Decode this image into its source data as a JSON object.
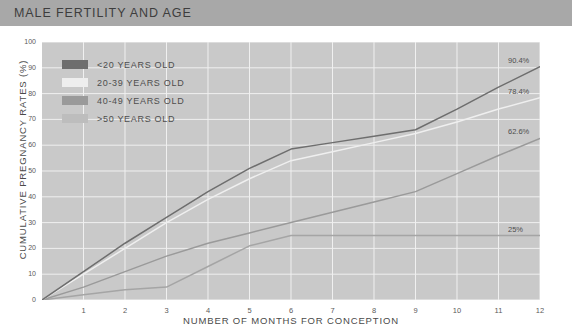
{
  "header": {
    "title": "MALE FERTILITY AND AGE",
    "bar_color": "#a8a8a8"
  },
  "legend": {
    "items": [
      {
        "label": "<20 YEARS OLD",
        "color": "#6e6e6e"
      },
      {
        "label": "20-39 YEARS OLD",
        "color": "#eeeeee"
      },
      {
        "label": "40-49 YEARS OLD",
        "color": "#9a9a9a"
      },
      {
        "label": ">50 YEARS OLD",
        "color": "#bdbdbd"
      }
    ]
  },
  "chart_data": {
    "type": "line",
    "title": "MALE FERTILITY AND AGE",
    "xlabel": "NUMBER OF MONTHS FOR CONCEPTION",
    "ylabel": "CUMULATIVE PREGNANCY RATES (%)",
    "xlim": [
      0,
      12
    ],
    "ylim": [
      0,
      100
    ],
    "xticks": [
      "1",
      "2",
      "3",
      "4",
      "5",
      "6",
      "7",
      "8",
      "9",
      "10",
      "11",
      "12"
    ],
    "yticks": [
      "0",
      "10",
      "20",
      "30",
      "40",
      "50",
      "60",
      "70",
      "80",
      "90",
      "100"
    ],
    "grid": true,
    "legend_position": "top-left",
    "plot_background": "#c9c9c9",
    "gridline_color": "#f0f0f0",
    "x": [
      0,
      1,
      2,
      3,
      4,
      5,
      6,
      7,
      8,
      9,
      10,
      11,
      12
    ],
    "series": [
      {
        "name": "<20 YEARS OLD",
        "color": "#6e6e6e",
        "values": [
          0,
          11,
          22,
          32,
          42,
          51,
          58.5,
          61,
          63.5,
          66,
          74,
          82.5,
          90.4
        ],
        "end_label": "90.4%"
      },
      {
        "name": "20-39 YEARS OLD",
        "color": "#efefef",
        "values": [
          0,
          10,
          20,
          30,
          39,
          47,
          54,
          57.5,
          61,
          64.5,
          69,
          74,
          78.4
        ],
        "end_label": "78.4%"
      },
      {
        "name": "40-49 YEARS OLD",
        "color": "#9a9a9a",
        "values": [
          0,
          5,
          11,
          17,
          22,
          26,
          30,
          34,
          38,
          42,
          49,
          56,
          62.6
        ],
        "end_label": "62.6%"
      },
      {
        "name": ">50 YEARS OLD",
        "color": "#a5a5a5",
        "values": [
          0,
          2,
          4,
          5,
          13,
          21,
          25,
          25,
          25,
          25,
          25,
          25,
          25
        ],
        "end_label": "25%"
      }
    ],
    "end_labels": [
      "90.4%",
      "78.4%",
      "62.6%",
      "25%"
    ]
  }
}
